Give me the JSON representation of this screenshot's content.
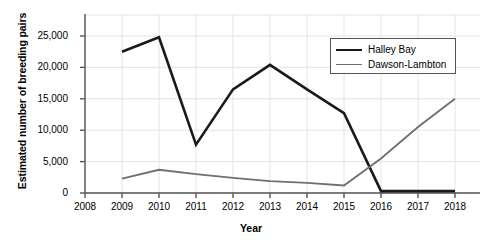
{
  "chart_data": {
    "type": "line",
    "title": "",
    "xlabel": "Year",
    "ylabel": "Estimated number of breeding pairs",
    "grid": true,
    "legend_position": "top-right",
    "x": [
      2009,
      2010,
      2011,
      2012,
      2013,
      2014,
      2015,
      2016,
      2017,
      2018
    ],
    "xlim": [
      2008,
      2018
    ],
    "ylim": [
      0,
      26500
    ],
    "xticks": [
      "2008",
      "2009",
      "2010",
      "2011",
      "2012",
      "2013",
      "2014",
      "2015",
      "2016",
      "2017",
      "2018"
    ],
    "yticks": [
      "0",
      "5,000",
      "10,000",
      "15,000",
      "20,000",
      "25,000"
    ],
    "ytick_values": [
      0,
      5000,
      10000,
      15000,
      20000,
      25000
    ],
    "series": [
      {
        "name": "Halley Bay",
        "color": "#1a1a1a",
        "width": 2.6,
        "values": [
          22500,
          24800,
          7700,
          16500,
          20400,
          16500,
          12700,
          300,
          300,
          300
        ]
      },
      {
        "name": "Dawson-Lambton",
        "color": "#6f6f6f",
        "width": 1.8,
        "values": [
          2300,
          3700,
          3000,
          2400,
          1900,
          1600,
          1200,
          5500,
          10500,
          15000
        ]
      }
    ]
  },
  "legend": {
    "entries": [
      {
        "label": "Halley Bay"
      },
      {
        "label": "Dawson-Lambton"
      }
    ]
  }
}
